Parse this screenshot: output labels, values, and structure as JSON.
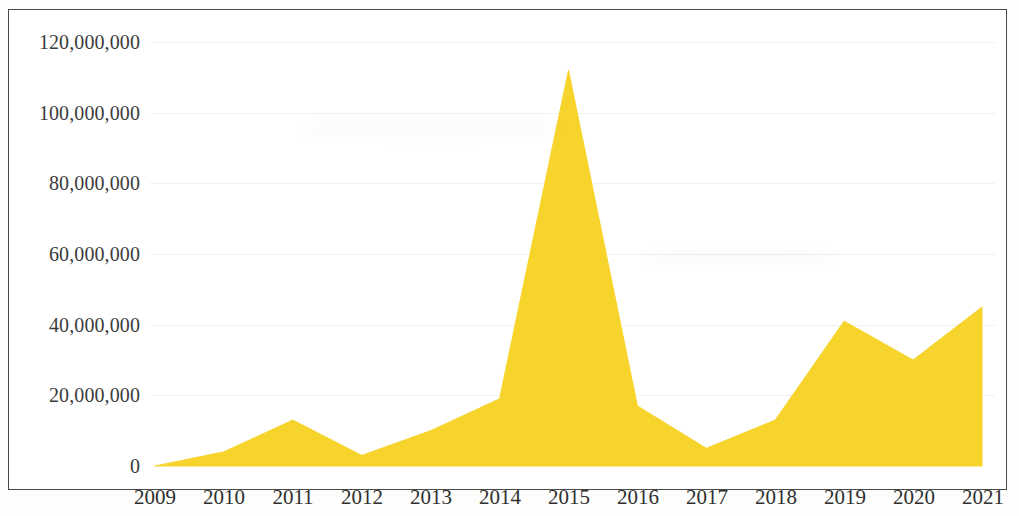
{
  "chart_data": {
    "type": "area",
    "title": "",
    "subtitle": "",
    "xlabel": "",
    "ylabel": "",
    "categories": [
      "2009",
      "2010",
      "2011",
      "2012",
      "2013",
      "2014",
      "2015",
      "2016",
      "2017",
      "2018",
      "2019",
      "2020",
      "2021"
    ],
    "values": [
      0,
      4000000,
      13000000,
      3000000,
      10000000,
      19000000,
      112000000,
      17000000,
      5000000,
      13000000,
      41000000,
      30000000,
      45000000
    ],
    "series": [
      {
        "name": "",
        "values": [
          0,
          4000000,
          13000000,
          3000000,
          10000000,
          19000000,
          112000000,
          17000000,
          5000000,
          13000000,
          41000000,
          30000000,
          45000000
        ]
      }
    ],
    "ylim": [
      0,
      120000000
    ],
    "xlim": [
      "2009",
      "2021"
    ],
    "y_ticks": [
      0,
      20000000,
      40000000,
      60000000,
      80000000,
      100000000,
      120000000
    ],
    "y_tick_labels": [
      "0",
      "20,000,000",
      "40,000,000",
      "60,000,000",
      "80,000,000",
      "100,000,000",
      "120,000,000"
    ],
    "x_tick_labels": [
      "2009",
      "2010",
      "2011",
      "2012",
      "2013",
      "2014",
      "2015",
      "2016",
      "2017",
      "2018",
      "2019",
      "2020",
      "2021"
    ],
    "grid": true,
    "legend": false,
    "legend_position": "none",
    "fill_color": "#F7D42B",
    "line_color": "#F7D42B",
    "background_color": "#FFFFFF",
    "axis_text_color": "#333333",
    "border_color": "#4A4A4A",
    "annotations": []
  },
  "axes": {
    "y_labels": [
      {
        "text": "120,000,000",
        "value": 120000000
      },
      {
        "text": "100,000,000",
        "value": 100000000
      },
      {
        "text": "80,000,000",
        "value": 80000000
      },
      {
        "text": "60,000,000",
        "value": 60000000
      },
      {
        "text": "40,000,000",
        "value": 40000000
      },
      {
        "text": "20,000,000",
        "value": 20000000
      },
      {
        "text": "0",
        "value": 0
      }
    ],
    "x_labels": [
      {
        "text": "2009"
      },
      {
        "text": "2010"
      },
      {
        "text": "2011"
      },
      {
        "text": "2012"
      },
      {
        "text": "2013"
      },
      {
        "text": "2014"
      },
      {
        "text": "2015"
      },
      {
        "text": "2016"
      },
      {
        "text": "2017"
      },
      {
        "text": "2018"
      },
      {
        "text": "2019"
      },
      {
        "text": "2020"
      },
      {
        "text": "2021"
      }
    ]
  }
}
